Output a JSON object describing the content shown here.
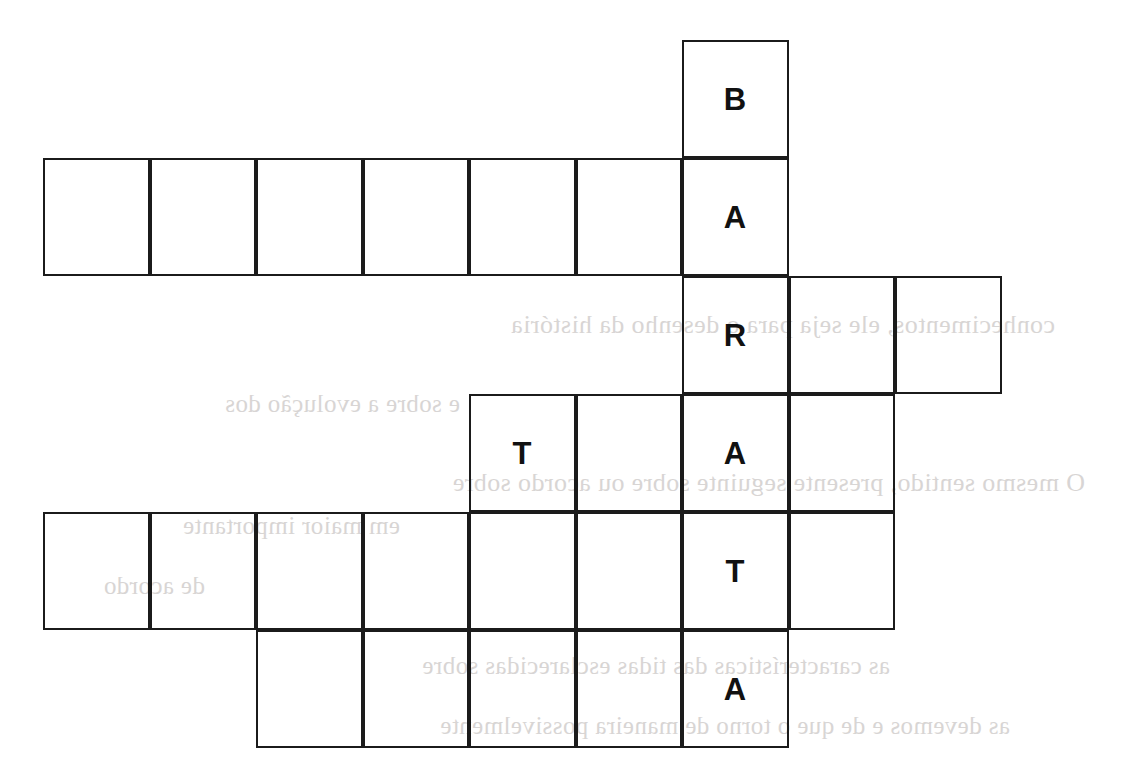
{
  "puzzle": {
    "type": "crossword-grid",
    "title": "",
    "vertical_answer": "BARATA",
    "geometry": {
      "origin_x": 43,
      "origin_y": 40,
      "cell_width": 106.5,
      "cell_height": 118,
      "border_color": "#1b1b1b",
      "border_width": 2,
      "background": "#ffffff",
      "letter_color": "#111111",
      "columns": 10,
      "rows": 6
    },
    "rows": [
      {
        "index": 0,
        "start_col": 6,
        "cells": [
          {
            "col": 6,
            "letter": "B",
            "filled": true
          }
        ]
      },
      {
        "index": 1,
        "start_col": 0,
        "cells": [
          {
            "col": 0,
            "letter": "",
            "filled": false
          },
          {
            "col": 1,
            "letter": "",
            "filled": false
          },
          {
            "col": 2,
            "letter": "",
            "filled": false
          },
          {
            "col": 3,
            "letter": "",
            "filled": false
          },
          {
            "col": 4,
            "letter": "",
            "filled": false
          },
          {
            "col": 5,
            "letter": "",
            "filled": false
          },
          {
            "col": 6,
            "letter": "A",
            "filled": true
          }
        ]
      },
      {
        "index": 2,
        "start_col": 6,
        "cells": [
          {
            "col": 6,
            "letter": "R",
            "filled": true
          },
          {
            "col": 7,
            "letter": "",
            "filled": false
          },
          {
            "col": 8,
            "letter": "",
            "filled": false
          }
        ]
      },
      {
        "index": 3,
        "start_col": 4,
        "cells": [
          {
            "col": 4,
            "letter": "T",
            "filled": true
          },
          {
            "col": 5,
            "letter": "",
            "filled": false
          },
          {
            "col": 6,
            "letter": "A",
            "filled": true
          },
          {
            "col": 7,
            "letter": "",
            "filled": false
          }
        ]
      },
      {
        "index": 4,
        "start_col": 0,
        "cells": [
          {
            "col": 0,
            "letter": "",
            "filled": false
          },
          {
            "col": 1,
            "letter": "",
            "filled": false
          },
          {
            "col": 2,
            "letter": "",
            "filled": false
          },
          {
            "col": 3,
            "letter": "",
            "filled": false
          },
          {
            "col": 4,
            "letter": "",
            "filled": false
          },
          {
            "col": 5,
            "letter": "",
            "filled": false
          },
          {
            "col": 6,
            "letter": "T",
            "filled": true
          },
          {
            "col": 7,
            "letter": "",
            "filled": false
          }
        ]
      },
      {
        "index": 5,
        "start_col": 2,
        "cells": [
          {
            "col": 2,
            "letter": "",
            "filled": false
          },
          {
            "col": 3,
            "letter": "",
            "filled": false
          },
          {
            "col": 4,
            "letter": "",
            "filled": false
          },
          {
            "col": 5,
            "letter": "",
            "filled": false
          },
          {
            "col": 6,
            "letter": "A",
            "filled": true
          }
        ]
      }
    ]
  },
  "page_bleed_through": {
    "visible": true,
    "note": "faint mirrored text showing through from the reverse side of the page",
    "lines": [
      {
        "text": "conhecimentos, ele seja para o desenho da história",
        "x": 1055,
        "y": 310,
        "size": 26
      },
      {
        "text": "e sobre a evolução dos",
        "x": 460,
        "y": 390,
        "size": 25
      },
      {
        "text": "O mesmo sentido, presente seguinte sobre ou acordo sobre",
        "x": 1085,
        "y": 468,
        "size": 26
      },
      {
        "text": "em maior importante",
        "x": 400,
        "y": 512,
        "size": 25
      },
      {
        "text": "de acordo",
        "x": 205,
        "y": 572,
        "size": 25
      },
      {
        "text": "as características das tidas esclarecidas sobre",
        "x": 890,
        "y": 652,
        "size": 25
      },
      {
        "text": "as devemos e de que o torno de maneira possivelmente",
        "x": 1010,
        "y": 712,
        "size": 25
      }
    ]
  }
}
